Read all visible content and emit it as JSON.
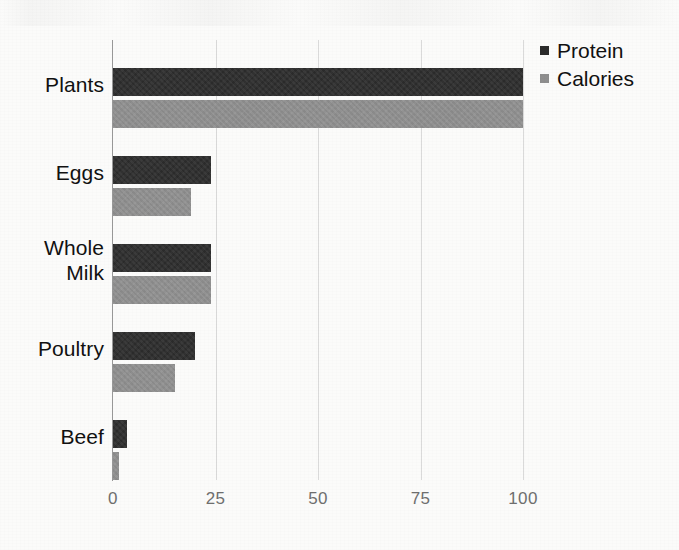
{
  "chart_data": {
    "type": "bar",
    "orientation": "horizontal",
    "title": "",
    "xlabel": "",
    "ylabel": "",
    "categories": [
      "Plants",
      "Eggs",
      "Whole Milk",
      "Poultry",
      "Beef"
    ],
    "series": [
      {
        "name": "Protein",
        "color": "#2b2b2b",
        "values": [
          100,
          24,
          24,
          20,
          3.5
        ]
      },
      {
        "name": "Calories",
        "color": "#8f8f8f",
        "values": [
          100,
          19,
          24,
          15,
          1.5
        ]
      }
    ],
    "xlim": [
      0,
      100
    ],
    "xticks": [
      0,
      25,
      50,
      75,
      100
    ],
    "xtick_labels": [
      "0",
      "25",
      "50",
      "75",
      "100"
    ],
    "grid": true,
    "grid_axis": "x",
    "legend_position": "top-right"
  },
  "legend": {
    "items": [
      {
        "label": "Protein",
        "marker": "square-marker-dark"
      },
      {
        "label": "Calories",
        "marker": "square-marker-gray"
      }
    ]
  },
  "axis": {
    "x_tick_labels": [
      "0",
      "25",
      "50",
      "75",
      "100"
    ]
  },
  "categories": {
    "labels": [
      "Plants",
      "Eggs",
      "Whole Milk",
      "Poultry",
      "Beef"
    ]
  },
  "colors": {
    "protein": "#2b2b2b",
    "calories": "#8f8f8f",
    "gridline": "#dadada",
    "axis": "#9a9a9a",
    "tick_text": "#6f6f6f",
    "label_text": "#111111",
    "background": "#fbfbfa"
  }
}
